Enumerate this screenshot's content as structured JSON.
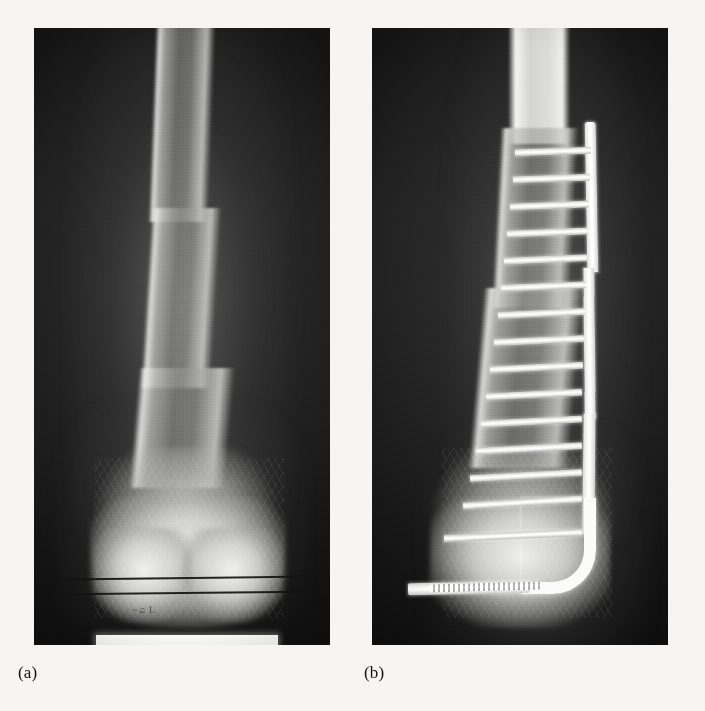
{
  "figure": {
    "background_color": "#f6f5f3",
    "panels": [
      {
        "id": "panel-a",
        "caption": "(a)",
        "description": "Anteroposterior radiograph of distal femur before surgery",
        "frame": {
          "x": 34,
          "y": 28,
          "width": 296,
          "height": 617
        },
        "annotations": {
          "ink_lines": 3,
          "handwritten_mark": "~ಎ L"
        }
      },
      {
        "id": "panel-b",
        "caption": "(b)",
        "description": "Postoperative radiograph showing condylar blade plate fixation with transverse screws",
        "frame": {
          "x": 372,
          "y": 28,
          "width": 296,
          "height": 617
        },
        "hardware": {
          "implant_name": "condylar-blade-plate",
          "screw_count": 16,
          "threaded_screw_count": 1
        }
      }
    ],
    "colors": {
      "film_black": "#0d0d0d",
      "bone_white": "#efefec",
      "metal_white": "#ffffff",
      "ink_black": "#14120f",
      "caption_text": "#16130f"
    }
  }
}
